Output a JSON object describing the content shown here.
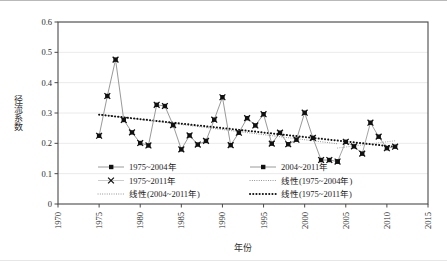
{
  "chart_data": {
    "type": "line",
    "title": "",
    "xlabel": "年份",
    "ylabel": "径流系数",
    "xlim": [
      1970,
      2015
    ],
    "ylim": [
      0,
      0.6
    ],
    "xticks": [
      1970,
      1975,
      1980,
      1985,
      1990,
      1995,
      2000,
      2005,
      2010,
      2015
    ],
    "yticks": [
      "0",
      "0.1",
      "0.2",
      "0.3",
      "0.4",
      "0.5",
      "0.6"
    ],
    "grid": "horizontal",
    "legend_position": "inside-bottom",
    "x": [
      1975,
      1976,
      1977,
      1978,
      1979,
      1980,
      1981,
      1982,
      1983,
      1984,
      1985,
      1986,
      1987,
      1988,
      1989,
      1990,
      1991,
      1992,
      1993,
      1994,
      1995,
      1996,
      1997,
      1998,
      1999,
      2000,
      2001,
      2002,
      2003,
      2004,
      2005,
      2006,
      2007,
      2008,
      2009,
      2010,
      2011
    ],
    "series": [
      {
        "name": "1975~2004年",
        "marker": "filled-square",
        "color": "#111111",
        "line_color": "#8d8d8d",
        "values": [
          0.225,
          0.356,
          0.476,
          0.277,
          0.236,
          0.201,
          0.193,
          0.327,
          0.323,
          0.26,
          0.18,
          0.226,
          0.196,
          0.208,
          0.278,
          0.352,
          0.194,
          0.235,
          0.283,
          0.259,
          0.296,
          0.199,
          0.235,
          0.197,
          0.212,
          0.301,
          0.218,
          0.145,
          0.145,
          0.14,
          null,
          null,
          null,
          null,
          null,
          null,
          null
        ]
      },
      {
        "name": "2004~2011年",
        "marker": "filled-square",
        "color": "#111111",
        "line_color": "#9a9a9a",
        "values": [
          null,
          null,
          null,
          null,
          null,
          null,
          null,
          null,
          null,
          null,
          null,
          null,
          null,
          null,
          null,
          null,
          null,
          null,
          null,
          null,
          null,
          null,
          null,
          null,
          null,
          null,
          null,
          null,
          null,
          0.14,
          0.205,
          0.19,
          0.166,
          0.268,
          0.222,
          0.184,
          0.189
        ]
      },
      {
        "name": "1975~2011年",
        "marker": "x",
        "color": "#111111",
        "values": [
          0.225,
          0.356,
          0.476,
          0.277,
          0.236,
          0.201,
          0.193,
          0.327,
          0.323,
          0.26,
          0.18,
          0.226,
          0.196,
          0.208,
          0.278,
          0.352,
          0.194,
          0.235,
          0.283,
          0.259,
          0.296,
          0.199,
          0.235,
          0.197,
          0.212,
          0.301,
          0.218,
          0.145,
          0.145,
          0.14,
          0.205,
          0.19,
          0.166,
          0.268,
          0.222,
          0.184,
          0.189
        ]
      }
    ],
    "trendlines": [
      {
        "name": "线性(1975~2004年)",
        "style": "fine-dotted",
        "color": "#8a8a8a",
        "x": [
          1975,
          2004
        ],
        "y": [
          0.2955,
          0.1985
        ]
      },
      {
        "name": "线性(2004~2011年)",
        "style": "fine-dotted",
        "color": "#a0a0a0",
        "x": [
          2004,
          2011
        ],
        "y": [
          0.1845,
          0.2085
        ]
      },
      {
        "name": "线性(1975~2011年)",
        "style": "thick-dotted",
        "color": "#111111",
        "x": [
          1975,
          2011
        ],
        "y": [
          0.2945,
          0.1885
        ]
      }
    ]
  },
  "legend": {
    "entries": [
      {
        "label": "1975~2004年",
        "kind": "line-marker-square"
      },
      {
        "label": "2004~2011年",
        "kind": "line-marker-square"
      },
      {
        "label": "1975~2011年",
        "kind": "marker-x"
      },
      {
        "label": "线性(1975~2004年)",
        "kind": "fine-dotted"
      },
      {
        "label": "线性(2004~2011年)",
        "kind": "fine-dotted"
      },
      {
        "label": "线性(1975~2011年)",
        "kind": "thick-dotted"
      }
    ]
  }
}
